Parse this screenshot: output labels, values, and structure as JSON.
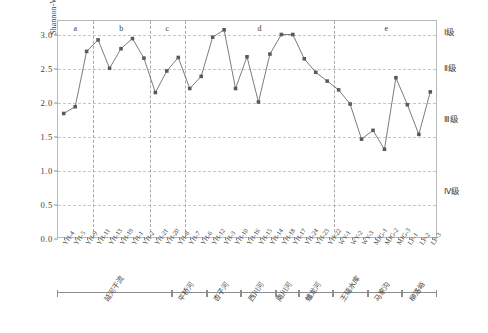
{
  "chart_data": {
    "type": "line",
    "title": "",
    "xlabel": "",
    "ylabel": "Shannon-Wiener多样性指数",
    "ylim": [
      0.0,
      3.2
    ],
    "yticks": [
      "0.0",
      "0.5",
      "1.0",
      "1.5",
      "2.0",
      "2.5",
      "3.0"
    ],
    "ytick_values": [
      0.0,
      0.5,
      1.0,
      1.5,
      2.0,
      2.5,
      3.0
    ],
    "grid": "horizontal-dashed",
    "legend": "none",
    "marker": "filled-square",
    "series_color": "#5a5a5a",
    "categories": [
      "YH-4",
      "YH-5",
      "YH-9",
      "YH-11",
      "YH-13",
      "YH-19",
      "YH-1",
      "YH-2",
      "YH-21",
      "YH-20",
      "YH-8",
      "YH-7",
      "YH-6",
      "YH-12",
      "YH-3",
      "YH-10",
      "YH-16",
      "YH-15",
      "YH-14",
      "YH-18",
      "YH-17",
      "YH-24",
      "YH-23",
      "YH-22",
      "WY-1",
      "WY-2",
      "WY-3",
      "MJG-1",
      "MJG-2",
      "MJG-3",
      "LP-1",
      "LP-2",
      "LP-3"
    ],
    "values": [
      1.83,
      1.93,
      2.75,
      2.92,
      2.5,
      2.79,
      2.94,
      2.65,
      2.14,
      2.46,
      2.66,
      2.2,
      2.38,
      2.96,
      3.07,
      2.2,
      2.67,
      2.0,
      2.71,
      3.0,
      3.0,
      2.64,
      2.44,
      2.31,
      2.18,
      1.97,
      1.45,
      1.58,
      1.3,
      2.36,
      1.96,
      1.52,
      2.15
    ],
    "group_letters": [
      {
        "label": "a",
        "start_index": 0,
        "end_index": 3
      },
      {
        "label": "b",
        "start_index": 3,
        "end_index": 8
      },
      {
        "label": "c",
        "start_index": 8,
        "end_index": 11
      },
      {
        "label": "d",
        "start_index": 11,
        "end_index": 24
      },
      {
        "label": "e",
        "start_index": 24,
        "end_index": 33
      }
    ],
    "group_boundaries": [
      3,
      8,
      11,
      24
    ],
    "quality_levels": [
      {
        "label": "Ⅰ级",
        "y_position": 3.06
      },
      {
        "label": "Ⅱ级",
        "y_position": 2.52
      },
      {
        "label": "Ⅲ级",
        "y_position": 1.78
      },
      {
        "label": "Ⅳ级",
        "y_position": 0.72
      }
    ],
    "reaches": [
      {
        "label": "延河干流",
        "start_index": 0,
        "end_index": 9
      },
      {
        "label": "平桥河",
        "start_index": 10,
        "end_index": 12
      },
      {
        "label": "杏子河",
        "start_index": 13,
        "end_index": 15
      },
      {
        "label": "西川河",
        "start_index": 16,
        "end_index": 18
      },
      {
        "label": "南川河",
        "start_index": 19,
        "end_index": 20
      },
      {
        "label": "蟠龙河",
        "start_index": 21,
        "end_index": 23
      },
      {
        "label": "王瑶水库",
        "start_index": 24,
        "end_index": 26
      },
      {
        "label": "马家沟",
        "start_index": 27,
        "end_index": 29
      },
      {
        "label": "柳洛峪",
        "start_index": 30,
        "end_index": 32
      }
    ]
  }
}
